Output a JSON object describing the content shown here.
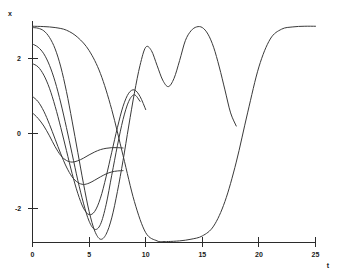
{
  "chart_data": {
    "type": "line",
    "title": "",
    "xlabel": "t",
    "ylabel": "x",
    "xlim": [
      0,
      25
    ],
    "ylim": [
      -3.45,
      3.3
    ],
    "grid": false,
    "legend": "none",
    "xticks": [
      0,
      5,
      10,
      15,
      20,
      25
    ],
    "xtick_labels": [
      "0",
      "5",
      "10",
      "15",
      "20",
      "25"
    ],
    "yticks": [
      2,
      0,
      -2
    ],
    "ytick_labels": [
      "2",
      "0",
      "-2"
    ],
    "series": [
      {
        "name": "x0 = 0.5",
        "x": [
          0,
          0.5,
          1,
          1.5,
          2,
          2.5,
          3,
          3.5,
          4,
          4.5,
          5,
          5.5,
          6,
          6.5,
          7,
          7.5,
          8
        ],
        "y": [
          0.5,
          0.33,
          0.1,
          -0.2,
          -0.53,
          -0.8,
          -0.95,
          -1.0,
          -0.96,
          -0.88,
          -0.78,
          -0.69,
          -0.62,
          -0.58,
          -0.56,
          -0.56,
          -0.57
        ]
      },
      {
        "name": "x0 = 1.0",
        "x": [
          0,
          0.5,
          1,
          1.5,
          2,
          2.5,
          3,
          3.5,
          4,
          4.5,
          5,
          5.5,
          6,
          6.5,
          7,
          7.5,
          8
        ],
        "y": [
          1.0,
          0.84,
          0.55,
          0.15,
          -0.3,
          -0.75,
          -1.15,
          -1.45,
          -1.62,
          -1.68,
          -1.64,
          -1.55,
          -1.45,
          -1.36,
          -1.3,
          -1.27,
          -1.26
        ]
      },
      {
        "name": "x0 = 2.0",
        "x": [
          0,
          0.5,
          1,
          1.5,
          2,
          2.5,
          3,
          3.5,
          4,
          4.5,
          5,
          5.5,
          6,
          6.5,
          7,
          7.5,
          8,
          8.5,
          9,
          9.5,
          10
        ],
        "y": [
          2.0,
          1.9,
          1.65,
          1.25,
          0.7,
          0.05,
          -0.65,
          -1.35,
          -1.95,
          -2.4,
          -2.6,
          -2.5,
          -2.1,
          -1.45,
          -0.7,
          0.05,
          0.7,
          1.1,
          1.2,
          1.0,
          0.6
        ]
      },
      {
        "name": "x0 = 2.6",
        "x": [
          0,
          0.5,
          1,
          1.5,
          2,
          2.5,
          3,
          3.5,
          4,
          4.5,
          5,
          5.5,
          6,
          6.5,
          7,
          7.5,
          8,
          8.5,
          9,
          9.5
        ],
        "y": [
          2.6,
          2.5,
          2.3,
          1.95,
          1.45,
          0.8,
          0.05,
          -0.75,
          -1.55,
          -2.25,
          -2.8,
          -3.05,
          -2.9,
          -2.3,
          -1.4,
          -0.5,
          0.3,
          0.85,
          1.05,
          0.85
        ]
      },
      {
        "name": "x0 = 3.1 (a)",
        "x": [
          0,
          0.5,
          1,
          1.5,
          2,
          2.5,
          3,
          3.5,
          4,
          4.5,
          5,
          5.5,
          6,
          6.5,
          7,
          7.5,
          8,
          8.5,
          9,
          9.5,
          10,
          10.5,
          11,
          11.5,
          12,
          12.5,
          13,
          13.5,
          14,
          14.5,
          15,
          15.5,
          16,
          16.5,
          17,
          17.5,
          18
        ],
        "y": [
          3.1,
          3.08,
          3.0,
          2.8,
          2.45,
          1.9,
          1.15,
          0.25,
          -0.7,
          -1.65,
          -2.5,
          -3.1,
          -3.35,
          -3.2,
          -2.7,
          -1.9,
          -0.95,
          0.1,
          1.1,
          1.95,
          2.5,
          2.4,
          1.95,
          1.5,
          1.3,
          1.55,
          2.1,
          2.7,
          3.0,
          3.12,
          3.1,
          2.9,
          2.5,
          1.9,
          1.2,
          0.5,
          0.1
        ]
      },
      {
        "name": "x0 = 3.14",
        "x": [
          0,
          1,
          2,
          3,
          4,
          5,
          6,
          7,
          8,
          9,
          10,
          11,
          11.5,
          12,
          13,
          14,
          15,
          16,
          17,
          18,
          19,
          20,
          21,
          22,
          23,
          24,
          25
        ],
        "y": [
          3.14,
          3.13,
          3.1,
          3.02,
          2.8,
          2.4,
          1.7,
          0.6,
          -0.8,
          -2.2,
          -3.15,
          -3.4,
          -3.42,
          -3.42,
          -3.4,
          -3.35,
          -3.25,
          -2.95,
          -2.2,
          -1.0,
          0.5,
          1.9,
          2.75,
          3.05,
          3.12,
          3.14,
          3.14
        ]
      }
    ]
  }
}
